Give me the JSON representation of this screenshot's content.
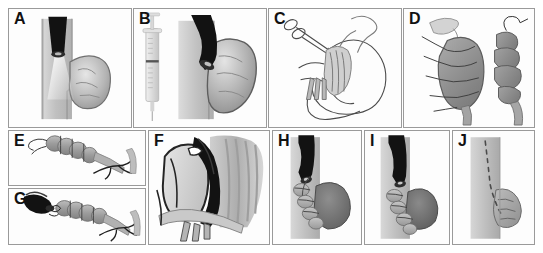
{
  "figure": {
    "type": "multi-panel-medical-illustration",
    "width": 543,
    "height": 253,
    "background_color": "#ffffff",
    "border_color": "#9a9a9a",
    "panel_count": 10,
    "layout": "grid, two rows: A-B-C-D on top, E/G-F-H-I-J on bottom"
  },
  "palette": {
    "ink": "#111111",
    "line": "#3a3a3a",
    "endoscope_black": "#111111",
    "lumen_grey": "#c3c3c3",
    "lumen_grey_dark": "#a9a9a9",
    "tissue_grey": "#8f8f8f",
    "tissue_grey_dark": "#6d6d6d",
    "tissue_light": "#d7d7d7",
    "highlight": "#f2f2f2",
    "frame": "#9a9a9a"
  },
  "panels": [
    {
      "id": "A",
      "label": "A",
      "x": 8,
      "y": 8,
      "w": 124,
      "h": 120,
      "content": "endoscope-in-lumen-with-diverticulum",
      "elements": [
        "lumen-tube",
        "black-endoscope",
        "light-beam",
        "diverticulum-sac"
      ]
    },
    {
      "id": "B",
      "label": "B",
      "x": 133,
      "y": 8,
      "w": 134,
      "h": 120,
      "content": "syringe-injection-and-angled-endoscope",
      "elements": [
        "syringe",
        "lumen-tube",
        "black-endoscope-angled",
        "distended-diverticulum"
      ]
    },
    {
      "id": "C",
      "label": "C",
      "x": 268,
      "y": 8,
      "w": 134,
      "h": 120,
      "content": "line-drawing-stomach-with-suturing-device",
      "elements": [
        "stomach-outline",
        "scissor-handles",
        "suture-thread",
        "grasper-jaws"
      ]
    },
    {
      "id": "D",
      "label": "D",
      "x": 403,
      "y": 8,
      "w": 132,
      "h": 120,
      "content": "diverticular-sac-with-running-sutures-and-plicated-result",
      "elements": [
        "open-sac",
        "suture-stitches",
        "plicated-sac",
        "needle-thread"
      ]
    },
    {
      "id": "E",
      "label": "E",
      "x": 8,
      "y": 130,
      "w": 138,
      "h": 56,
      "content": "plicated-segmented-tube-with-thread",
      "elements": [
        "segmented-plication",
        "suture-tails"
      ]
    },
    {
      "id": "G",
      "label": "G",
      "x": 8,
      "y": 188,
      "w": 138,
      "h": 57,
      "content": "endoscope-tip-engaging-plicated-segments",
      "elements": [
        "black-endoscope-tip",
        "segmented-plication",
        "suture-tails"
      ]
    },
    {
      "id": "F",
      "label": "F",
      "x": 148,
      "y": 130,
      "w": 122,
      "h": 115,
      "content": "magnified-anatomical-view-endoscope-through-tissue-layers",
      "elements": [
        "tissue-flap",
        "curved-black-endoscope",
        "mucosal-folds",
        "muscle-fibers"
      ]
    },
    {
      "id": "H",
      "label": "H",
      "x": 272,
      "y": 130,
      "w": 90,
      "h": 115,
      "content": "endoscope-withdrawn-sutures-placed",
      "elements": [
        "lumen-tube",
        "black-endoscope",
        "sutured-segments",
        "diverticulum-sac"
      ]
    },
    {
      "id": "I",
      "label": "I",
      "x": 364,
      "y": 130,
      "w": 86,
      "h": 115,
      "content": "further-suture-tightening",
      "elements": [
        "lumen-tube",
        "black-endoscope",
        "sutured-segments",
        "reduced-sac"
      ]
    },
    {
      "id": "J",
      "label": "J",
      "x": 452,
      "y": 130,
      "w": 83,
      "h": 115,
      "content": "final-result-closed-suture-line",
      "elements": [
        "lumen-tube",
        "dashed-suture-line",
        "collapsed-sac"
      ]
    }
  ]
}
